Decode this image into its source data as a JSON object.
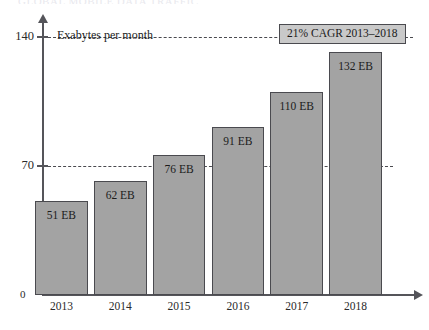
{
  "title_clipped": "GLOBAL MOBILE DATA TRAFFIC",
  "axis_note": "Exabytes per month",
  "origin_label": "0",
  "annotation": {
    "label": "21% CAGR 2013–2018"
  },
  "colors": {
    "bar_fill": "#a3a3a3",
    "bar_border": "#4a4a4f",
    "axis": "#55555a",
    "gridline": "#4a4a4f",
    "annotation_fill": "#c9c9c9"
  },
  "chart_data": {
    "type": "bar",
    "title": "",
    "xlabel": "",
    "ylabel": "Exabytes per month",
    "categories": [
      "2013",
      "2014",
      "2015",
      "2016",
      "2017",
      "2018"
    ],
    "values": [
      51,
      62,
      76,
      91,
      110,
      132
    ],
    "value_labels": [
      "51 EB",
      "62 EB",
      "76 EB",
      "91 EB",
      "110 EB",
      "132 EB"
    ],
    "ylim": [
      0,
      148
    ],
    "yticks": [
      70,
      140
    ],
    "ytick_labels": [
      "70",
      "140"
    ],
    "gridlines": [
      70,
      140
    ],
    "grid": true,
    "legend": "none",
    "units": "EB",
    "annotations": [
      "21% CAGR 2013–2018",
      "Exabytes per month"
    ]
  }
}
